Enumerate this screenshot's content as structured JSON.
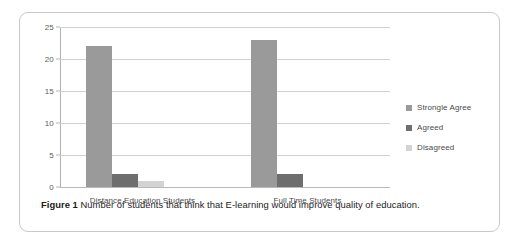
{
  "figure": {
    "caption_label": "Figure 1",
    "caption_text": "Number of students that think that E-learning would improve quality of education."
  },
  "chart_data": {
    "type": "bar",
    "title": "",
    "xlabel": "",
    "ylabel": "",
    "ylim": [
      0,
      25
    ],
    "yticks": [
      "0",
      "5",
      "10",
      "15",
      "20",
      "25"
    ],
    "grid": true,
    "legend_position": "right",
    "categories": [
      "Distance Education Students",
      "Full Time Students"
    ],
    "series": [
      {
        "name": "Strongle Agree",
        "color": "#9a9a9a",
        "values": [
          22,
          23
        ]
      },
      {
        "name": "Agreed",
        "color": "#6e6e6e",
        "values": [
          2,
          2
        ]
      },
      {
        "name": "Disagreed",
        "color": "#d3d3d3",
        "values": [
          1,
          0
        ]
      }
    ]
  }
}
